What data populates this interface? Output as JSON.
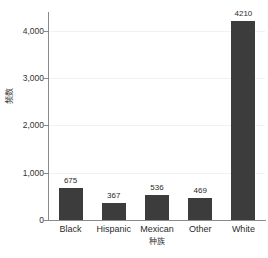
{
  "chart_data": {
    "type": "bar",
    "title": "",
    "subtitle": "",
    "xlabel": "种族",
    "ylabel": "频数",
    "categories": [
      "Black",
      "Hispanic",
      "Mexican",
      "Other",
      "White"
    ],
    "values": [
      675,
      367,
      536,
      469,
      4210
    ],
    "value_labels": [
      "675",
      "367",
      "536",
      "469",
      "4210"
    ],
    "ylim": [
      0,
      4400
    ],
    "yticks": [
      0,
      1000,
      2000,
      3000,
      4000
    ],
    "ytick_labels": [
      "0",
      "1,000",
      "2,000",
      "3,000",
      "4,000"
    ],
    "grid": true,
    "legend": null,
    "legend_position": "none",
    "series": [
      {
        "name": "频数",
        "values": [
          675,
          367,
          536,
          469,
          4210
        ]
      }
    ]
  },
  "style": {
    "bar_color": "#3c3c3c",
    "axis_color": "#8a8a8a",
    "grid_color": "#f2f2f2",
    "text_color": "#2b2b2b",
    "background": "#ffffff"
  }
}
